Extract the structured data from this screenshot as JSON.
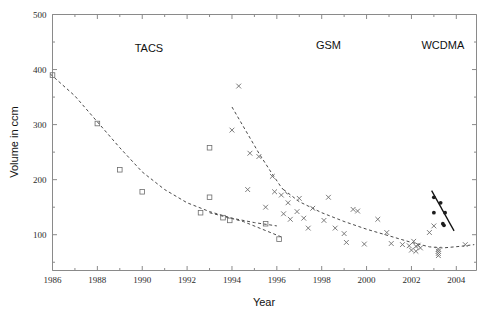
{
  "figure": {
    "background": "#ffffff",
    "width": 492,
    "height": 320
  },
  "chart_data": {
    "type": "scatter",
    "title": "",
    "xlabel": "Year",
    "ylabel": "Volume in ccm",
    "xlim": [
      1986,
      2004.9
    ],
    "ylim": [
      35,
      500
    ],
    "grid": false,
    "legend": "none",
    "x_ticks_major": [
      1986,
      1988,
      1990,
      1992,
      1994,
      1996,
      1998,
      2000,
      2002,
      2004
    ],
    "x_tick_labels": [
      "1986",
      "1988",
      "1990",
      "1992",
      "1994",
      "1996",
      "1998",
      "2000",
      "2002",
      "2004"
    ],
    "x_ticks_minor": [
      1987,
      1989,
      1991,
      1993,
      1995,
      1997,
      1999,
      2001,
      2003
    ],
    "y_ticks_major": [
      100,
      200,
      300,
      400,
      500
    ],
    "y_tick_labels": [
      "100",
      "200",
      "300",
      "400",
      "500"
    ],
    "y_ticks_minor": [
      50,
      150,
      250,
      350,
      450
    ],
    "annotations": [
      {
        "text": "TACS",
        "x": 1990.3,
        "y": 432,
        "name": "annotation-tacs"
      },
      {
        "text": "GSM",
        "x": 1998.3,
        "y": 438,
        "name": "annotation-gsm"
      },
      {
        "text": "WCDMA",
        "x": 2003.4,
        "y": 438,
        "name": "annotation-wcdma"
      }
    ],
    "series": [
      {
        "name": "TACS",
        "marker": "square",
        "color": "#6d6d6d",
        "points": [
          {
            "x": 1986.0,
            "y": 390
          },
          {
            "x": 1988.0,
            "y": 302
          },
          {
            "x": 1989.0,
            "y": 218
          },
          {
            "x": 1990.0,
            "y": 178
          },
          {
            "x": 1992.6,
            "y": 140
          },
          {
            "x": 1993.0,
            "y": 168
          },
          {
            "x": 1993.0,
            "y": 258
          },
          {
            "x": 1993.6,
            "y": 131
          },
          {
            "x": 1993.9,
            "y": 126
          },
          {
            "x": 1995.5,
            "y": 120
          },
          {
            "x": 1996.1,
            "y": 92
          }
        ]
      },
      {
        "name": "GSM",
        "marker": "cross",
        "color": "#6d6d6d",
        "points": [
          {
            "x": 1994.3,
            "y": 370
          },
          {
            "x": 1994.0,
            "y": 290
          },
          {
            "x": 1994.8,
            "y": 248
          },
          {
            "x": 1995.2,
            "y": 242
          },
          {
            "x": 1994.7,
            "y": 182
          },
          {
            "x": 1995.8,
            "y": 206
          },
          {
            "x": 1995.9,
            "y": 178
          },
          {
            "x": 1996.2,
            "y": 172
          },
          {
            "x": 1995.5,
            "y": 150
          },
          {
            "x": 1996.5,
            "y": 158
          },
          {
            "x": 1996.3,
            "y": 138
          },
          {
            "x": 1996.9,
            "y": 142
          },
          {
            "x": 1996.6,
            "y": 128
          },
          {
            "x": 1997.2,
            "y": 130
          },
          {
            "x": 1997.0,
            "y": 166
          },
          {
            "x": 1997.6,
            "y": 148
          },
          {
            "x": 1997.4,
            "y": 112
          },
          {
            "x": 1998.1,
            "y": 126
          },
          {
            "x": 1998.3,
            "y": 168
          },
          {
            "x": 1998.6,
            "y": 112
          },
          {
            "x": 1999.0,
            "y": 102
          },
          {
            "x": 1999.4,
            "y": 146
          },
          {
            "x": 1999.6,
            "y": 143
          },
          {
            "x": 1999.1,
            "y": 86
          },
          {
            "x": 1999.9,
            "y": 83
          },
          {
            "x": 2000.5,
            "y": 128
          },
          {
            "x": 2000.9,
            "y": 104
          },
          {
            "x": 2001.1,
            "y": 84
          },
          {
            "x": 2001.6,
            "y": 82
          },
          {
            "x": 2001.9,
            "y": 80
          },
          {
            "x": 2002.1,
            "y": 88
          },
          {
            "x": 2002.2,
            "y": 79
          },
          {
            "x": 2002.3,
            "y": 81
          },
          {
            "x": 2002.0,
            "y": 72
          },
          {
            "x": 2002.2,
            "y": 70
          },
          {
            "x": 2002.4,
            "y": 76
          },
          {
            "x": 2003.0,
            "y": 116
          },
          {
            "x": 2002.8,
            "y": 104
          },
          {
            "x": 2003.2,
            "y": 74
          },
          {
            "x": 2003.2,
            "y": 70
          },
          {
            "x": 2003.2,
            "y": 66
          },
          {
            "x": 2003.2,
            "y": 62
          },
          {
            "x": 2004.4,
            "y": 82
          }
        ]
      },
      {
        "name": "WCDMA",
        "marker": "dot",
        "color": "#1d1d1d",
        "points": [
          {
            "x": 2003.0,
            "y": 168
          },
          {
            "x": 2003.3,
            "y": 158
          },
          {
            "x": 2003.0,
            "y": 140
          },
          {
            "x": 2003.5,
            "y": 140
          },
          {
            "x": 2003.4,
            "y": 120
          },
          {
            "x": 2003.45,
            "y": 117
          }
        ]
      }
    ],
    "trend_lines": [
      {
        "name": "tacs-trend",
        "style": "dashed",
        "path": [
          {
            "x": 1985.9,
            "y": 392
          },
          {
            "x": 1987.0,
            "y": 352
          },
          {
            "x": 1988.0,
            "y": 305
          },
          {
            "x": 1989.0,
            "y": 258
          },
          {
            "x": 1990.0,
            "y": 214
          },
          {
            "x": 1991.0,
            "y": 182
          },
          {
            "x": 1992.0,
            "y": 158
          },
          {
            "x": 1993.0,
            "y": 142
          },
          {
            "x": 1994.0,
            "y": 130
          },
          {
            "x": 1995.0,
            "y": 122
          },
          {
            "x": 1996.0,
            "y": 116
          }
        ]
      },
      {
        "name": "tacs-late-trend",
        "style": "dashed",
        "path": [
          {
            "x": 1993.0,
            "y": 140
          },
          {
            "x": 1994.5,
            "y": 124
          },
          {
            "x": 1996.2,
            "y": 96
          }
        ]
      },
      {
        "name": "gsm-early-trend",
        "style": "dashed",
        "path": [
          {
            "x": 1994.0,
            "y": 332
          },
          {
            "x": 1994.6,
            "y": 290
          },
          {
            "x": 1995.2,
            "y": 248
          },
          {
            "x": 1995.8,
            "y": 210
          },
          {
            "x": 1996.2,
            "y": 186
          },
          {
            "x": 1996.6,
            "y": 168
          }
        ]
      },
      {
        "name": "gsm-main-trend",
        "style": "dashed",
        "path": [
          {
            "x": 1996.3,
            "y": 182
          },
          {
            "x": 1997.0,
            "y": 160
          },
          {
            "x": 1998.0,
            "y": 140
          },
          {
            "x": 1999.0,
            "y": 124
          },
          {
            "x": 2000.0,
            "y": 110
          },
          {
            "x": 2001.0,
            "y": 98
          },
          {
            "x": 2002.0,
            "y": 86
          },
          {
            "x": 2002.8,
            "y": 78
          },
          {
            "x": 2003.4,
            "y": 76
          },
          {
            "x": 2004.2,
            "y": 79
          },
          {
            "x": 2004.8,
            "y": 82
          }
        ]
      },
      {
        "name": "wcdma-trend",
        "style": "solid",
        "path": [
          {
            "x": 2002.9,
            "y": 180
          },
          {
            "x": 2003.9,
            "y": 107
          }
        ]
      }
    ]
  }
}
